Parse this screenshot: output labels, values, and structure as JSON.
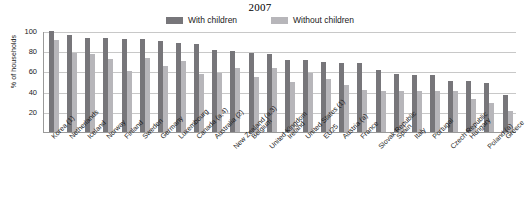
{
  "chart_data": {
    "type": "bar",
    "title": "2007",
    "xlabel": "",
    "ylabel": "% of households",
    "ylim": [
      0,
      100
    ],
    "yticks": [
      0,
      20,
      40,
      60,
      80,
      100
    ],
    "ytick_labels": [
      "20",
      "40",
      "60",
      "80",
      "100"
    ],
    "grid": true,
    "legend_position": "top-center",
    "categories": [
      "Korea (1)",
      "Netherlands",
      "Iceland",
      "Norway",
      "Finland",
      "Sweden",
      "Germany",
      "Luxembourg",
      "Canada (a,4)",
      "Australia (2)",
      "New Zealand (a,3)",
      "Belgium",
      "United Kingdom",
      "Ireland",
      "United States (1)",
      "EU25",
      "Austria (a)",
      "France",
      "Slovak Republic",
      "Spain",
      "Italy",
      "Portugal",
      "Czech Republic",
      "Hungary",
      "Poland (a)",
      "Greece"
    ],
    "series": [
      {
        "name": "With children",
        "color": "#77767a",
        "values": [
          100,
          96,
          93,
          93,
          92,
          92,
          90,
          88,
          87,
          81,
          80,
          78,
          77,
          71,
          71,
          69,
          68,
          68,
          61,
          57,
          56,
          56,
          51,
          51,
          49,
          37
        ]
      },
      {
        "name": "Without children",
        "color": "#b7b6ba",
        "values": [
          91,
          78,
          77,
          72,
          60,
          73,
          65,
          70,
          57,
          58,
          63,
          54,
          63,
          50,
          58,
          52,
          47,
          42,
          41,
          41,
          41,
          41,
          41,
          33,
          29,
          21
        ]
      }
    ]
  },
  "legend": {
    "entries": [
      {
        "label": "With children",
        "color": "#77767a"
      },
      {
        "label": "Without children",
        "color": "#b7b6ba"
      }
    ]
  },
  "axis": {
    "y_title": "% of households"
  }
}
